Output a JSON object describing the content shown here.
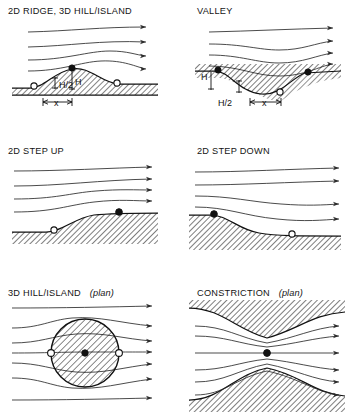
{
  "figure": {
    "width": 362,
    "height": 417,
    "background": "#ffffff",
    "ink_color": "#111111",
    "streamline_color": "#2b2b2b"
  },
  "panels": [
    {
      "id": "ridge-hill-island",
      "title": "2D RIDGE, 3D HILL/ISLAND",
      "plan_suffix": "",
      "position": {
        "x": 0,
        "y": 0
      },
      "dimension_labels": [
        "H/2",
        "H",
        "x"
      ],
      "markers": [
        {
          "type": "open-circle",
          "role": "separation-point-upwind"
        },
        {
          "type": "filled-circle",
          "role": "crest-speed-up-point"
        },
        {
          "type": "open-circle",
          "role": "separation-point-downwind"
        }
      ],
      "streamline_count": 4,
      "terrain": "symmetric hill / ridge crest"
    },
    {
      "id": "valley",
      "title": "VALLEY",
      "plan_suffix": "",
      "position": {
        "x": 181,
        "y": 0
      },
      "dimension_labels": [
        "H",
        "H/2",
        "x"
      ],
      "markers": [
        {
          "type": "filled-circle",
          "role": "upwind-rim-point"
        },
        {
          "type": "open-circle",
          "role": "valley-floor-point"
        },
        {
          "type": "filled-circle",
          "role": "downwind-rim-point"
        }
      ],
      "streamline_count": 4,
      "terrain": "valley depression"
    },
    {
      "id": "step-up",
      "title": "2D STEP UP",
      "plan_suffix": "",
      "position": {
        "x": 0,
        "y": 140
      },
      "dimension_labels": [],
      "markers": [
        {
          "type": "open-circle",
          "role": "toe-of-slope-point"
        },
        {
          "type": "filled-circle",
          "role": "top-of-slope-point"
        }
      ],
      "streamline_count": 4,
      "terrain": "upward escarpment"
    },
    {
      "id": "step-down",
      "title": "2D STEP DOWN",
      "plan_suffix": "",
      "position": {
        "x": 181,
        "y": 140
      },
      "dimension_labels": [],
      "markers": [
        {
          "type": "filled-circle",
          "role": "brink-of-slope-point"
        },
        {
          "type": "open-circle",
          "role": "base-of-slope-point"
        }
      ],
      "streamline_count": 4,
      "terrain": "downward escarpment"
    },
    {
      "id": "hill-island-plan",
      "title": "3D HILL/ISLAND",
      "plan_suffix": "(plan)",
      "position": {
        "x": 0,
        "y": 280
      },
      "dimension_labels": [],
      "markers": [
        {
          "type": "open-circle",
          "role": "lateral-edge-left"
        },
        {
          "type": "filled-circle",
          "role": "island-centre"
        },
        {
          "type": "open-circle",
          "role": "lateral-edge-right"
        }
      ],
      "streamline_count": 7,
      "terrain": "circular island, plan view, hatched"
    },
    {
      "id": "constriction-plan",
      "title": "CONSTRICTION",
      "plan_suffix": "(plan)",
      "position": {
        "x": 181,
        "y": 280
      },
      "dimension_labels": [],
      "markers": [
        {
          "type": "filled-circle",
          "role": "throat-centre-point"
        }
      ],
      "streamline_count": 6,
      "terrain": "narrowing channel between hatched banks, plan view"
    }
  ],
  "legend": {
    "open_circle_meaning": "open circle marker",
    "filled_circle_meaning": "filled circle marker"
  }
}
